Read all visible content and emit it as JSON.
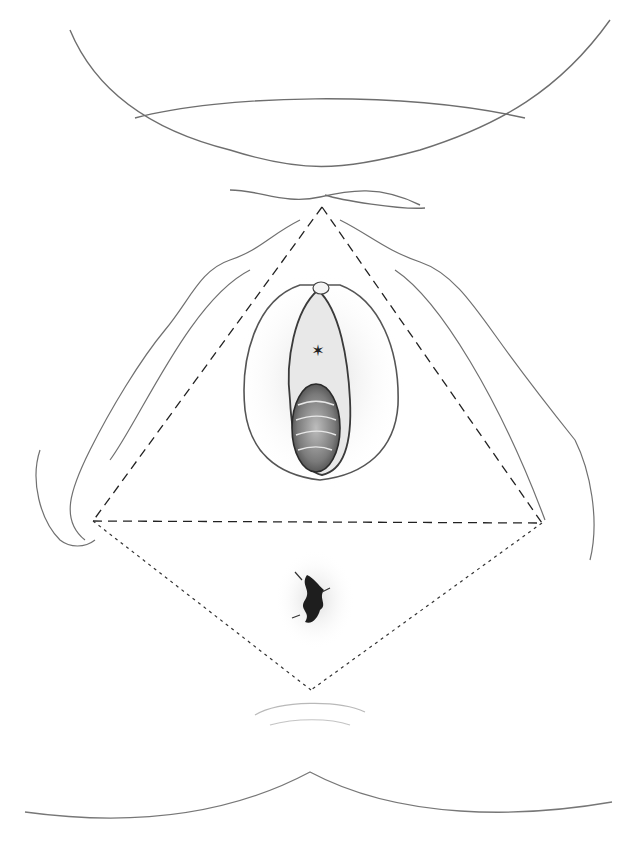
{
  "figure": {
    "title": "Perineal region with urogenital and anal triangles",
    "type": "anatomical line illustration",
    "background_color": "#ffffff",
    "stroke_color": "#555555",
    "dashed_lines": {
      "urogenital_triangle": {
        "apex": [
          322,
          207
        ],
        "left": [
          93,
          521
        ],
        "right": [
          542,
          523
        ],
        "style": "long-dash"
      },
      "anal_triangle": {
        "left": [
          93,
          521
        ],
        "right": [
          542,
          523
        ],
        "apex": [
          311,
          690
        ],
        "style": "short-dot"
      }
    },
    "markers": [
      {
        "symbol": "star",
        "position": [
          318,
          350
        ]
      }
    ]
  }
}
